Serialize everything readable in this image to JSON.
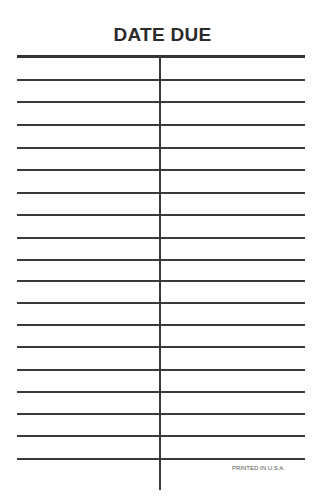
{
  "card": {
    "title": "DATE DUE",
    "footer": "PRINTED IN U.S.A.",
    "row_lines_y": [
      79,
      101,
      124,
      147,
      169,
      192,
      214,
      237,
      259,
      280,
      302,
      324,
      346,
      369,
      391,
      413,
      435,
      458
    ],
    "columns": 2
  }
}
